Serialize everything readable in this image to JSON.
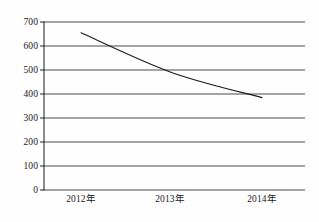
{
  "chart_data": {
    "type": "line",
    "title": "",
    "subtitle": "",
    "xlabel": "",
    "ylabel": "",
    "categories": [
      "2012年",
      "2013年",
      "2014年"
    ],
    "series": [
      {
        "name": "",
        "values": [
          655,
          490,
          385
        ]
      }
    ],
    "ylim": [
      0,
      700
    ],
    "ytick_labels": [
      "0",
      "100",
      "200",
      "300",
      "400",
      "500",
      "600",
      "700"
    ],
    "ytick_values": [
      0,
      100,
      200,
      300,
      400,
      500,
      600,
      700
    ],
    "grid": true,
    "grid_orientation": "horizontal",
    "legend": false,
    "legend_position": "none",
    "markers": false,
    "annotations": [],
    "colors": {
      "line": "#1c1c1c",
      "grid": "#4a4a4a",
      "axis": "#1c1c1c",
      "background": "#fefefe",
      "text": "#1a1a1a"
    }
  }
}
